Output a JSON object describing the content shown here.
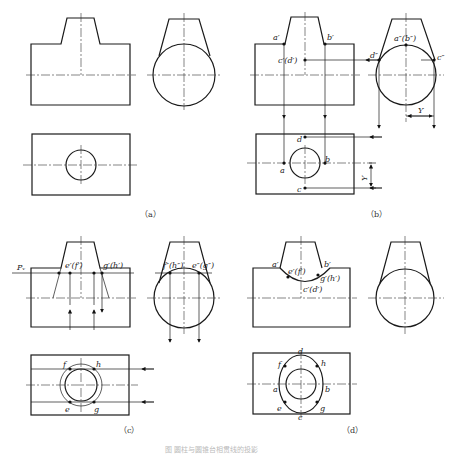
{
  "figure": {
    "caption": "图 圆柱与圆锥台相贯线的投影",
    "panels": [
      {
        "id": "a",
        "label": "（a）"
      },
      {
        "id": "b",
        "label": "（b）"
      },
      {
        "id": "c",
        "label": "（c）"
      },
      {
        "id": "d",
        "label": "（d）"
      }
    ]
  },
  "labels": {
    "b": {
      "a_prime": "a′",
      "b_prime": "b′",
      "c_prime_d_prime": "c′(d′)",
      "a2_b2": "a″(b″)",
      "d2": "d″",
      "c2": "c″",
      "y_side": "Y",
      "d": "d",
      "a": "a",
      "b": "b",
      "c": "c",
      "y_top": "Y"
    },
    "c": {
      "pv": "Pᵥ",
      "e_prime_f_prime": "e′(f′)",
      "g_prime_h_prime": "g′(h′)",
      "f2_h2": "f″(h″)",
      "e2_g2": "e″(g″)",
      "f": "f",
      "h": "h",
      "e": "e",
      "g": "g"
    },
    "d": {
      "a_prime": "a′",
      "b_prime": "b′",
      "e_prime_f_prime": "e′(f′)",
      "g_prime_h_prime": "g′(h′)",
      "c_prime_d_prime": "c′(d′)",
      "d": "d",
      "f": "f",
      "h": "h",
      "a": "a",
      "b": "b",
      "e": "e",
      "g": "g",
      "c": "c"
    }
  }
}
